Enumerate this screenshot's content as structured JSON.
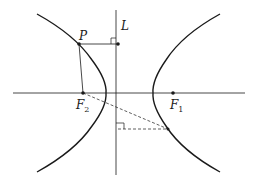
{
  "diagram": {
    "type": "hyperbola",
    "colors": {
      "stroke": "#1a1a1a",
      "background": "#ffffff"
    },
    "labels": {
      "P": "P",
      "L": "L",
      "F2_main": "F",
      "F2_sub": "2",
      "F1_main": "F",
      "F1_sub": "1"
    },
    "points": {
      "P": [
        79,
        44
      ],
      "L_foot_P": [
        118,
        44
      ],
      "F2": [
        83,
        93
      ],
      "F1": [
        173,
        93
      ],
      "Q": [
        168,
        129
      ],
      "L_foot_Q": [
        118,
        129
      ]
    },
    "axes": {
      "horizontal": {
        "x1": 13,
        "x2": 245,
        "y": 93
      },
      "directrix_L": {
        "x": 116,
        "y1": 10,
        "y2": 175
      }
    }
  }
}
